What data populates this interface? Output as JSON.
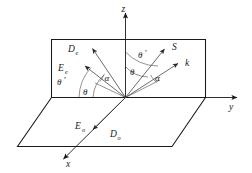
{
  "axes": [
    {
      "name": "z-axis",
      "label": "z",
      "direction": "up"
    },
    {
      "name": "y-axis",
      "label": "y",
      "direction": "right"
    },
    {
      "name": "x-axis",
      "label": "x",
      "direction": "down-left"
    }
  ],
  "vectors": [
    {
      "name": "displacement-extraordinary",
      "base": "D",
      "subscript": "e",
      "label": "De"
    },
    {
      "name": "electric-field-extraordinary",
      "base": "E",
      "subscript": "e",
      "label": "Ee"
    },
    {
      "name": "poynting-vector",
      "base": "S",
      "subscript": "",
      "label": "S"
    },
    {
      "name": "wave-vector",
      "base": "k",
      "subscript": "",
      "label": "k"
    },
    {
      "name": "electric-field-ordinary",
      "base": "E",
      "subscript": "o",
      "label": "Eo"
    },
    {
      "name": "displacement-ordinary",
      "base": "D",
      "subscript": "o",
      "label": "Do"
    }
  ],
  "angles": [
    {
      "name": "theta-prime-left",
      "label": "θ",
      "prime": "′",
      "side": "left-outer"
    },
    {
      "name": "theta-left",
      "label": "θ",
      "prime": "",
      "side": "left-inner"
    },
    {
      "name": "alpha-left",
      "label": "α",
      "prime": "",
      "side": "left-between"
    },
    {
      "name": "theta-prime-right",
      "label": "θ",
      "prime": "′",
      "side": "right-outer"
    },
    {
      "name": "theta-right",
      "label": "θ",
      "prime": "",
      "side": "right-inner"
    },
    {
      "name": "alpha-right",
      "label": "α",
      "prime": "",
      "side": "right-between"
    }
  ],
  "colors": {
    "line": "#1a1a1a",
    "ray": "#3a3a3a",
    "arc": "#4a4a4a",
    "background": "#ffffff"
  }
}
